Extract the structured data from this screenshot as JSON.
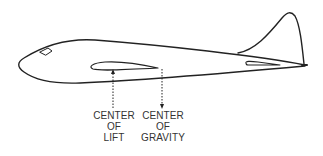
{
  "diagram": {
    "line_color": "#222222",
    "labels": {
      "center_of_lift": [
        "CENTER",
        "OF",
        "LIFT"
      ],
      "center_of_gravity": [
        "CENTER",
        "OF",
        "GRAVITY"
      ]
    },
    "arrows": {
      "center_of_lift": {
        "direction": "up",
        "style": "dotted"
      },
      "center_of_gravity": {
        "direction": "down",
        "style": "dotted"
      }
    }
  }
}
